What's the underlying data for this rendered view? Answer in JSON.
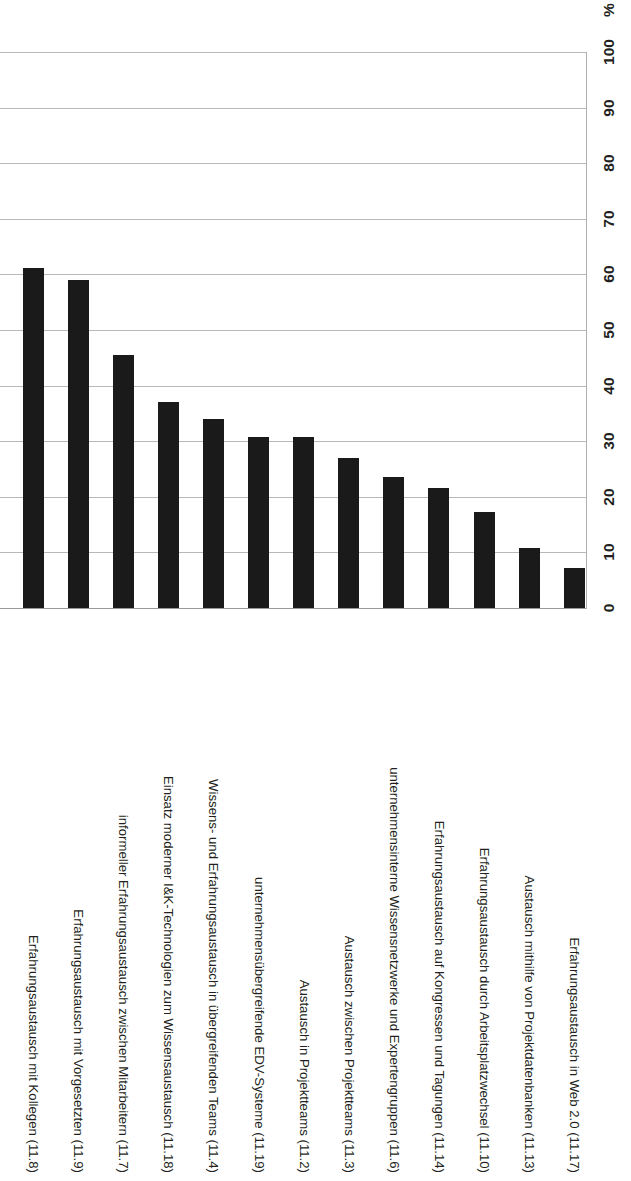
{
  "chart_data": {
    "type": "bar",
    "title": "",
    "subtitle": "",
    "xlabel": "",
    "ylabel": "%",
    "orientation": "vertical",
    "grid": true,
    "legend": null,
    "ylim": [
      0,
      100
    ],
    "yticks": [
      0,
      10,
      20,
      30,
      40,
      50,
      60,
      70,
      80,
      90,
      100
    ],
    "ytick_labels": [
      "0",
      "10",
      "20",
      "30",
      "40",
      "50",
      "60",
      "70",
      "80",
      "90",
      "100"
    ],
    "axis_unit_label": "%",
    "bar_color": "#1a1a1a",
    "gridline_color": "#b8b8b8",
    "categories": [
      "Erfahrungsaustausch mit Kollegen (11.8)",
      "Erfahrungsaustausch mit Vorgesetzten (11.9)",
      "informeller Erfahrungsaustausch zwischen Mitarbeitern (11.7)",
      "Einsatz moderner I&K-Technologien zum Wissensaustausch (11.18)",
      "Wissens- und Erfahrungsaustausch in übergreifenden Teams (11.4)",
      "unternehmensübergreifende EDV-Systeme (11.19)",
      "Austausch in Projektteams (11.2)",
      "Austausch zwischen Projektteams (11.3)",
      "unternehmensinterne Wissensnetzwerke und Expertengruppen (11.6)",
      "Erfahrungsaustausch auf Kongressen und Tagungen (11.14)",
      "Erfahrungsaustausch durch Arbeitsplatzwechsel (11.10)",
      "Austausch mithilfe von Projektdatenbanken (11.13)",
      "Erfahrungsaustausch in Web 2.0 (11.17)"
    ],
    "values": [
      61.2,
      59.0,
      45.5,
      37.0,
      34.0,
      30.8,
      30.7,
      27.0,
      23.6,
      21.6,
      17.3,
      10.8,
      7.2
    ]
  }
}
